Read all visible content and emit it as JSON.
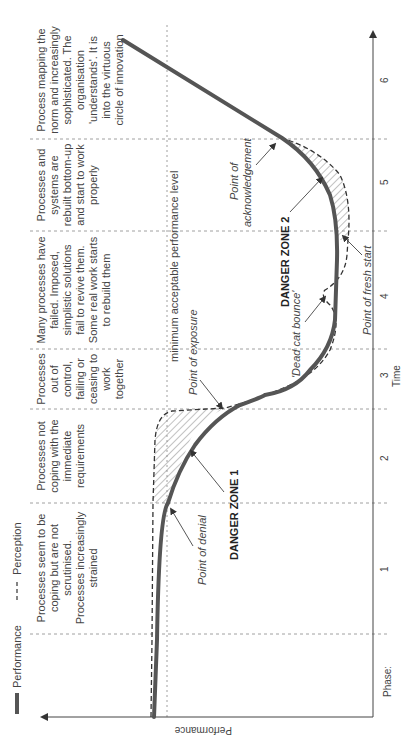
{
  "legend": {
    "performance": "Performance",
    "perception": "Perception"
  },
  "axes": {
    "x_label": "Time",
    "y_label": "Performance",
    "phase_label": "Phase:",
    "ticks": [
      "1",
      "2",
      "3",
      "4",
      "5",
      "6"
    ]
  },
  "phases": [
    {
      "id": 1,
      "lines": [
        "Processes seem to be",
        "coping but are not",
        "scrutinised.",
        "Processes increasingly",
        "strained"
      ]
    },
    {
      "id": 2,
      "lines": [
        "Processes not",
        "coping with the",
        "immediate",
        "requirements"
      ]
    },
    {
      "id": 3,
      "lines": [
        "Processes",
        "out of",
        "control,",
        "failing or",
        "ceasing to",
        "work",
        "together"
      ]
    },
    {
      "id": 4,
      "lines": [
        "Many processes have",
        "failed. Imposed,",
        "simplistic solutions",
        "fail to revive them.",
        "Some real work starts",
        "to rebuild them"
      ]
    },
    {
      "id": 5,
      "lines": [
        "Processes and",
        "systems are",
        "rebuilt bottom-up",
        "and start to work",
        "properly"
      ]
    },
    {
      "id": 6,
      "lines": [
        "Process mapping the",
        "norm and increasingly",
        "sophisticated. The",
        "organisation",
        "'understands'. It is",
        "into the virtuous",
        "circle of innovation"
      ]
    }
  ],
  "annotations": {
    "min_level": "minimum acceptable performance level",
    "point_of_denial": "Point of denial",
    "point_of_exposure": "Point of exposure",
    "dead_cat_bounce": "'Dead cat bounce'",
    "point_of_fresh_start": "Point of fresh start",
    "point_of_acknowledgement_1": "Point of",
    "point_of_acknowledgement_2": "acknowledgement",
    "danger_zone_1": "DANGER ZONE 1",
    "danger_zone_2": "DANGER ZONE 2"
  },
  "colors": {
    "performance_line": "#555555",
    "perception_line": "#333333",
    "grid": "#888888"
  }
}
